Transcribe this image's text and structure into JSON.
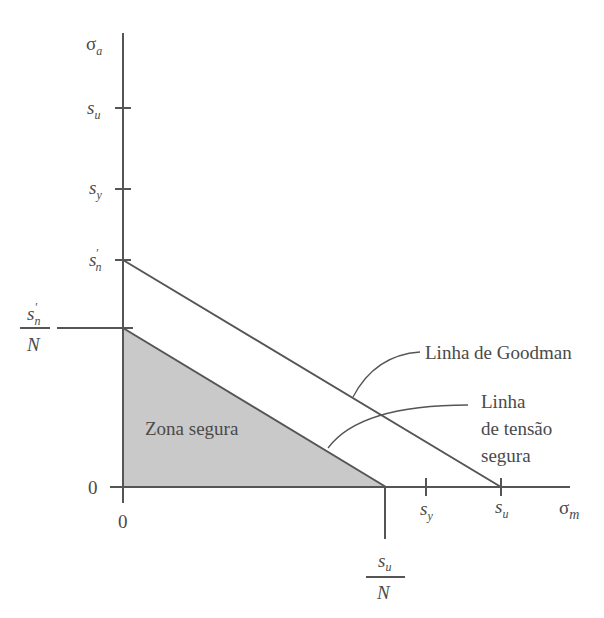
{
  "diagram": {
    "axes": {
      "y_axis": {
        "label": "σ",
        "label_sub": "a"
      },
      "x_axis": {
        "label": "σ",
        "label_sub": "m"
      },
      "origin_x_label": "0",
      "origin_y_label": "0"
    },
    "y_ticks": [
      {
        "label": "s",
        "sub": "u",
        "prime": ""
      },
      {
        "label": "s",
        "sub": "y",
        "prime": ""
      },
      {
        "label": "s",
        "sub": "n",
        "prime": "′"
      }
    ],
    "x_ticks": [
      {
        "label": "s",
        "sub": "y"
      },
      {
        "label": "s",
        "sub": "u"
      }
    ],
    "y_fraction": {
      "num": "s",
      "num_sub": "n",
      "num_prime": "′",
      "den": "N"
    },
    "x_fraction": {
      "num": "s",
      "num_sub": "u",
      "den": "N"
    },
    "region_label": "Zona segura",
    "annotations": {
      "goodman": "Linha de Goodman",
      "safe_line_1": "Linha",
      "safe_line_2": "de tensão",
      "safe_line_3": "segura"
    },
    "colors": {
      "line": "#555555",
      "fill": "#c8c8c8",
      "text": "#4a4a4a"
    }
  }
}
